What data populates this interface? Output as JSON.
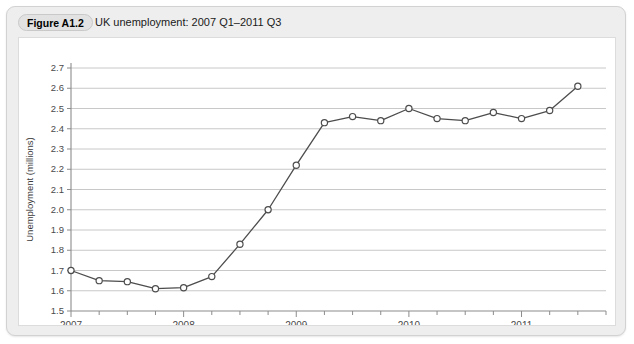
{
  "figure": {
    "badge": "Figure A1.2",
    "caption": "UK unemployment: 2007 Q1–2011 Q3"
  },
  "chart_data": {
    "type": "line",
    "title": "UK unemployment: 2007 Q1–2011 Q3",
    "xlabel": "",
    "ylabel": "Unemployment (millions)",
    "ylim": [
      1.5,
      2.7
    ],
    "ytick_labels": [
      "1.5",
      "1.6",
      "1.7",
      "1.8",
      "1.9",
      "2.0",
      "2.1",
      "2.2",
      "2.3",
      "2.4",
      "2.5",
      "2.6",
      "2.7"
    ],
    "ytick_values": [
      1.5,
      1.6,
      1.7,
      1.8,
      1.9,
      2.0,
      2.1,
      2.2,
      2.3,
      2.4,
      2.5,
      2.6,
      2.7
    ],
    "xtick_labels": [
      "2007",
      "2008",
      "2009",
      "2010",
      "2011"
    ],
    "xtick_years": [
      2007,
      2008,
      2009,
      2010,
      2011
    ],
    "xlim": [
      2007.0,
      2011.75
    ],
    "grid": "horizontal",
    "legend": "none",
    "markers": "open-circle",
    "x": [
      "2007 Q1",
      "2007 Q2",
      "2007 Q3",
      "2007 Q4",
      "2008 Q1",
      "2008 Q2",
      "2008 Q3",
      "2008 Q4",
      "2009 Q1",
      "2009 Q2",
      "2009 Q3",
      "2009 Q4",
      "2010 Q1",
      "2010 Q2",
      "2010 Q3",
      "2010 Q4",
      "2011 Q1",
      "2011 Q2",
      "2011 Q3"
    ],
    "values": [
      1.7,
      1.65,
      1.645,
      1.61,
      1.615,
      1.67,
      1.83,
      2.0,
      2.22,
      2.43,
      2.46,
      2.44,
      2.5,
      2.45,
      2.44,
      2.48,
      2.45,
      2.49,
      2.61
    ],
    "series": [
      {
        "name": "UK unemployment (millions)",
        "values": [
          1.7,
          1.65,
          1.645,
          1.61,
          1.615,
          1.67,
          1.83,
          2.0,
          2.22,
          2.43,
          2.46,
          2.44,
          2.5,
          2.45,
          2.44,
          2.48,
          2.45,
          2.49,
          2.61
        ]
      }
    ],
    "colors": {
      "line": "#4d4d4d",
      "marker_fill": "#ffffff",
      "gridline": "#c8c8c8",
      "axis": "#8c8c8c",
      "panel_background": "#eeeeee",
      "plot_background": "#ffffff"
    }
  }
}
